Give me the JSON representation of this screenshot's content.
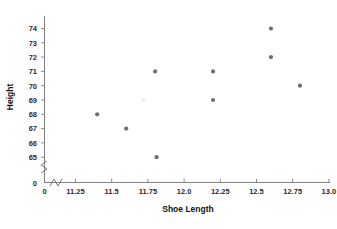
{
  "chart_data": {
    "type": "scatter",
    "title": "",
    "xlabel": "Shoe Length",
    "ylabel": "Height",
    "xlim": [
      11.125,
      13.1
    ],
    "ylim": [
      64.3,
      74.6
    ],
    "grid": false,
    "legend": null,
    "x_ticks": [
      "0",
      "11.25",
      "11.5",
      "11.75",
      "12.0",
      "12.25",
      "12.5",
      "12.75",
      "13.0"
    ],
    "y_ticks": [
      "0",
      "65",
      "66",
      "67",
      "68",
      "69",
      "70",
      "71",
      "72",
      "73",
      "74"
    ],
    "axis_break_x": true,
    "axis_break_y": true,
    "marker_color": "#6f6f6f",
    "points": [
      {
        "x": 11.4,
        "y": 68,
        "faint": false
      },
      {
        "x": 11.6,
        "y": 67,
        "faint": false
      },
      {
        "x": 11.72,
        "y": 69,
        "faint": true
      },
      {
        "x": 11.8,
        "y": 71,
        "faint": false
      },
      {
        "x": 11.81,
        "y": 65,
        "faint": false
      },
      {
        "x": 12.2,
        "y": 71,
        "faint": false
      },
      {
        "x": 12.2,
        "y": 69,
        "faint": false
      },
      {
        "x": 12.6,
        "y": 74,
        "faint": false
      },
      {
        "x": 12.6,
        "y": 72,
        "faint": false
      },
      {
        "x": 12.8,
        "y": 70,
        "faint": false
      }
    ],
    "x_values": [
      11.4,
      11.6,
      11.72,
      11.8,
      11.81,
      12.2,
      12.2,
      12.6,
      12.6,
      12.8
    ],
    "y_values": [
      68,
      67,
      69,
      71,
      65,
      71,
      69,
      74,
      72,
      70
    ]
  },
  "axes": {
    "x_title": "Shoe Length",
    "y_title": "Height"
  },
  "ticks": {
    "x": {
      "zero": "0",
      "t1": "11.25",
      "t2": "11.5",
      "t3": "11.75",
      "t4": "12.0",
      "t5": "12.25",
      "t6": "12.5",
      "t7": "12.75",
      "t8": "13.0"
    },
    "y": {
      "zero": "0",
      "t65": "65",
      "t66": "66",
      "t67": "67",
      "t68": "68",
      "t69": "69",
      "t70": "70",
      "t71": "71",
      "t72": "72",
      "t73": "73",
      "t74": "74"
    }
  }
}
